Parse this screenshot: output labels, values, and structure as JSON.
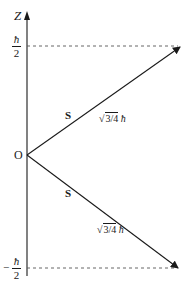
{
  "diagram": {
    "axis": {
      "label": "Z",
      "color": "#1a1a1a"
    },
    "levels": {
      "upper": {
        "sign": "",
        "numerator": "ħ",
        "denominator": "2"
      },
      "lower": {
        "sign": "−",
        "numerator": "ħ",
        "denominator": "2"
      }
    },
    "origin_label": "O",
    "vectors": [
      {
        "name": "spin-up",
        "label": "S",
        "magnitude_root": "√",
        "magnitude_radicand": "3/4",
        "magnitude_unit": "ħ"
      },
      {
        "name": "spin-down",
        "label": "S",
        "magnitude_root": "√",
        "magnitude_radicand": "3/4",
        "magnitude_unit": "ħ"
      }
    ],
    "colors": {
      "line": "#1a1a1a",
      "dashed": "#555555",
      "background": "#ffffff"
    }
  }
}
